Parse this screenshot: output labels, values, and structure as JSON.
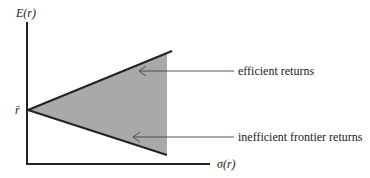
{
  "diagram": {
    "y_axis_label": "E(r)",
    "x_axis_label": "σ(r)",
    "origin_label": "r̄",
    "annotations": [
      {
        "id": "efficient",
        "label": "efficient returns"
      },
      {
        "id": "inefficient",
        "label": "inefficient frontier returns"
      }
    ],
    "colors": {
      "fill": "#a9a9a9",
      "line": "#222222",
      "arrow": "#444444"
    }
  }
}
